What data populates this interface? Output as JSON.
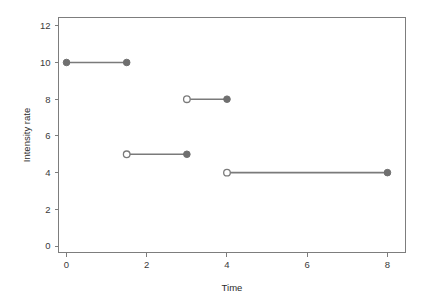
{
  "chart_data": {
    "type": "line",
    "title": "",
    "xlabel": "Time",
    "ylabel": "Intensity rate",
    "xlim": [
      -0.2,
      8.45
    ],
    "ylim": [
      -0.35,
      12.45
    ],
    "xticks": [
      0,
      2,
      4,
      6,
      8
    ],
    "xtick_labels": [
      "0",
      "2",
      "4",
      "6",
      "8"
    ],
    "yticks": [
      0,
      2,
      4,
      6,
      8,
      10,
      12
    ],
    "ytick_labels": [
      "0",
      "2",
      "4",
      "6",
      "8",
      "10",
      "12"
    ],
    "grid": false,
    "legend": "none",
    "line_color": "#7a7a7a",
    "marker_fill_color": "#6f6f6f",
    "marker_open_color": "#ffffff",
    "axis_color": "#7d7d7d",
    "background_color": "#ffffff",
    "segments": [
      {
        "name": "segment-1",
        "y": 10,
        "x_start": 0,
        "x_end": 1.5,
        "start_marker": "filled",
        "end_marker": "filled"
      },
      {
        "name": "segment-2",
        "y": 5,
        "x_start": 1.5,
        "x_end": 3,
        "start_marker": "open",
        "end_marker": "filled"
      },
      {
        "name": "segment-3",
        "y": 8,
        "x_start": 3,
        "x_end": 4,
        "start_marker": "open",
        "end_marker": "filled"
      },
      {
        "name": "segment-4",
        "y": 4,
        "x_start": 4,
        "x_end": 8,
        "start_marker": "open",
        "end_marker": "filled"
      }
    ],
    "points": [
      {
        "x": 0,
        "y": 10,
        "marker": "filled"
      },
      {
        "x": 1.5,
        "y": 10,
        "marker": "filled"
      },
      {
        "x": 1.5,
        "y": 5,
        "marker": "open"
      },
      {
        "x": 3,
        "y": 5,
        "marker": "filled"
      },
      {
        "x": 3,
        "y": 8,
        "marker": "open"
      },
      {
        "x": 4,
        "y": 8,
        "marker": "filled"
      },
      {
        "x": 4,
        "y": 4,
        "marker": "open"
      },
      {
        "x": 8,
        "y": 4,
        "marker": "filled"
      }
    ]
  }
}
